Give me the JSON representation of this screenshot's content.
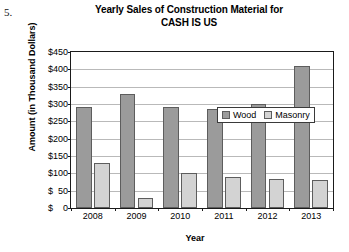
{
  "problem_number": "5.",
  "chart_data": {
    "type": "bar",
    "title": "Yearly Sales of Construction Material for CASH IS US",
    "title_lines": [
      "Yearly Sales of Construction Material for",
      "CASH IS US"
    ],
    "xlabel": "Year",
    "ylabel": "Amount (in Thousand Dollars)",
    "categories": [
      "2008",
      "2009",
      "2010",
      "2011",
      "2012",
      "2013"
    ],
    "series": [
      {
        "name": "Wood",
        "color": "#9b9b9b",
        "values": [
          290,
          330,
          290,
          285,
          300,
          410
        ]
      },
      {
        "name": "Masonry",
        "color": "#d3d3d3",
        "values": [
          130,
          30,
          100,
          90,
          85,
          80
        ]
      }
    ],
    "ylim": [
      0,
      450
    ],
    "ytick_values": [
      450,
      400,
      350,
      300,
      250,
      200,
      150,
      100,
      50,
      0
    ],
    "ytick_labels": [
      "$450",
      "$400",
      "$350",
      "$300",
      "$250",
      "$200",
      "$150",
      "$100",
      "$  50",
      "$    0"
    ],
    "grid": true,
    "legend_position": "top-center-inside",
    "legend_entries": [
      "Wood",
      "Masonry"
    ]
  }
}
